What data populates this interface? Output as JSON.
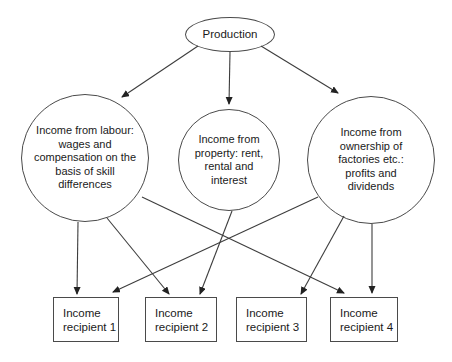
{
  "figure": {
    "production": {
      "label": "Production"
    },
    "income_sources": {
      "labour": {
        "lines": [
          "Income from labour:",
          "wages and",
          "compensation on the",
          "basis of skill",
          "differences"
        ]
      },
      "property": {
        "lines": [
          "Income from",
          "property: rent,",
          "rental and",
          "interest"
        ]
      },
      "ownership": {
        "lines": [
          "Income from",
          "ownership of",
          "factories etc.:",
          "profits and",
          "dividends"
        ]
      }
    },
    "recipients": [
      {
        "lines": [
          "Income",
          "recipient 1"
        ]
      },
      {
        "lines": [
          "Income",
          "recipient 2"
        ]
      },
      {
        "lines": [
          "Income",
          "recipient 3"
        ]
      },
      {
        "lines": [
          "Income",
          "recipient 4"
        ]
      }
    ],
    "connections": {
      "from_production": [
        "labour",
        "property",
        "ownership"
      ],
      "to_recipients": [
        {
          "from": "labour",
          "to": "recipient 1"
        },
        {
          "from": "labour",
          "to": "recipient 2"
        },
        {
          "from": "labour",
          "to": "recipient 4"
        },
        {
          "from": "property",
          "to": "recipient 2"
        },
        {
          "from": "ownership",
          "to": "recipient 1"
        },
        {
          "from": "ownership",
          "to": "recipient 3"
        },
        {
          "from": "ownership",
          "to": "recipient 4"
        }
      ]
    },
    "colors": {
      "stroke": "#3d3d3d",
      "text": "#1a1a1a",
      "background": "#ffffff"
    }
  }
}
